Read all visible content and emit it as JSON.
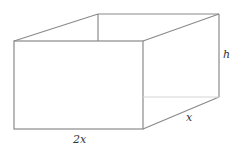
{
  "diagram": {
    "type": "rectangular-box",
    "labels": {
      "height": "h",
      "depth": "x",
      "width": "2x"
    },
    "colors": {
      "stroke": "#8a8a8a",
      "hidden_stroke": "#d4d4d4",
      "text": "#333333"
    }
  }
}
